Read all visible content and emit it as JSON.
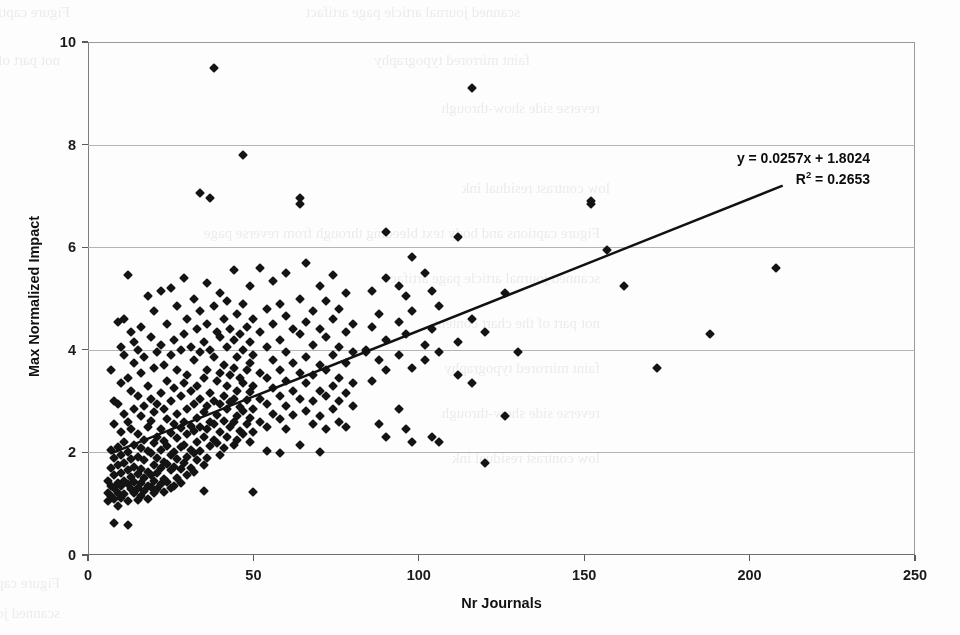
{
  "page": {
    "background_color": "#fdfdfd",
    "width": 960,
    "height": 635,
    "scan_bleed_text": [
      "Figure captions and body text bleeding through from reverse page",
      "scanned journal article page artifact",
      "not part of the chart content",
      "faint mirrored typography",
      "reverse side show-through",
      "low contrast residual ink"
    ]
  },
  "chart_data": {
    "type": "scatter",
    "title": "",
    "xlabel": "Nr Journals",
    "ylabel": "Max Normalized Impact",
    "xlim": [
      0,
      250
    ],
    "ylim": [
      0,
      10
    ],
    "xticks": [
      0,
      50,
      100,
      150,
      200,
      250
    ],
    "yticks": [
      0,
      2,
      4,
      6,
      8,
      10
    ],
    "grid": "horizontal",
    "legend": "none",
    "marker": "diamond",
    "marker_color": "#141414",
    "marker_size": 7,
    "annotations": {
      "equation": "y = 0.0257x + 1.8024",
      "r_squared_prefix": "R",
      "r_squared_exponent": "2",
      "r_squared_value": " = 0.2653"
    },
    "trendline": {
      "type": "linear",
      "slope": 0.0257,
      "intercept": 1.8024,
      "r_squared": 0.2653,
      "x_start": 7,
      "x_end": 210,
      "color": "#111111",
      "width": 2.4
    },
    "points": [
      [
        6,
        1.45
      ],
      [
        6,
        1.2
      ],
      [
        6,
        1.05
      ],
      [
        7,
        3.6
      ],
      [
        7,
        2.05
      ],
      [
        7,
        1.7
      ],
      [
        7,
        1.35
      ],
      [
        7,
        1.15
      ],
      [
        8,
        3.0
      ],
      [
        8,
        2.55
      ],
      [
        8,
        1.9
      ],
      [
        8,
        1.55
      ],
      [
        8,
        1.3
      ],
      [
        8,
        1.1
      ],
      [
        8,
        0.62
      ],
      [
        9,
        4.55
      ],
      [
        9,
        2.95
      ],
      [
        9,
        2.1
      ],
      [
        9,
        1.75
      ],
      [
        9,
        1.4
      ],
      [
        9,
        1.2
      ],
      [
        9,
        0.95
      ],
      [
        10,
        4.05
      ],
      [
        10,
        3.35
      ],
      [
        10,
        2.4
      ],
      [
        10,
        1.95
      ],
      [
        10,
        1.6
      ],
      [
        10,
        1.35
      ],
      [
        10,
        1.12
      ],
      [
        11,
        4.6
      ],
      [
        11,
        3.9
      ],
      [
        11,
        2.75
      ],
      [
        11,
        2.2
      ],
      [
        11,
        1.8
      ],
      [
        11,
        1.45
      ],
      [
        11,
        1.18
      ],
      [
        12,
        5.45
      ],
      [
        12,
        3.45
      ],
      [
        12,
        2.6
      ],
      [
        12,
        2.0
      ],
      [
        12,
        1.65
      ],
      [
        12,
        1.38
      ],
      [
        12,
        1.05
      ],
      [
        12,
        0.58
      ],
      [
        13,
        4.35
      ],
      [
        13,
        3.2
      ],
      [
        13,
        2.45
      ],
      [
        13,
        1.88
      ],
      [
        13,
        1.52
      ],
      [
        13,
        1.28
      ],
      [
        14,
        4.15
      ],
      [
        14,
        3.75
      ],
      [
        14,
        2.85
      ],
      [
        14,
        2.15
      ],
      [
        14,
        1.72
      ],
      [
        14,
        1.42
      ],
      [
        14,
        1.2
      ],
      [
        15,
        4.0
      ],
      [
        15,
        3.1
      ],
      [
        15,
        2.35
      ],
      [
        15,
        1.92
      ],
      [
        15,
        1.58
      ],
      [
        15,
        1.3
      ],
      [
        15,
        1.08
      ],
      [
        16,
        4.45
      ],
      [
        16,
        3.55
      ],
      [
        16,
        2.7
      ],
      [
        16,
        2.08
      ],
      [
        16,
        1.68
      ],
      [
        16,
        1.4
      ],
      [
        16,
        1.15
      ],
      [
        17,
        3.85
      ],
      [
        17,
        2.9
      ],
      [
        17,
        2.25
      ],
      [
        17,
        1.85
      ],
      [
        17,
        1.5
      ],
      [
        17,
        1.25
      ],
      [
        18,
        5.05
      ],
      [
        18,
        3.3
      ],
      [
        18,
        2.5
      ],
      [
        18,
        2.02
      ],
      [
        18,
        1.62
      ],
      [
        18,
        1.35
      ],
      [
        18,
        1.1
      ],
      [
        19,
        4.25
      ],
      [
        19,
        3.05
      ],
      [
        19,
        2.62
      ],
      [
        19,
        1.98
      ],
      [
        19,
        1.55
      ],
      [
        19,
        1.32
      ],
      [
        20,
        4.75
      ],
      [
        20,
        3.65
      ],
      [
        20,
        2.78
      ],
      [
        20,
        2.18
      ],
      [
        20,
        1.75
      ],
      [
        20,
        1.45
      ],
      [
        20,
        1.2
      ],
      [
        21,
        3.95
      ],
      [
        21,
        2.95
      ],
      [
        21,
        2.3
      ],
      [
        21,
        1.9
      ],
      [
        21,
        1.6
      ],
      [
        21,
        1.28
      ],
      [
        22,
        5.15
      ],
      [
        22,
        4.1
      ],
      [
        22,
        3.15
      ],
      [
        22,
        2.45
      ],
      [
        22,
        2.05
      ],
      [
        22,
        1.7
      ],
      [
        22,
        1.38
      ],
      [
        23,
        3.7
      ],
      [
        23,
        2.85
      ],
      [
        23,
        2.22
      ],
      [
        23,
        1.82
      ],
      [
        23,
        1.48
      ],
      [
        23,
        1.22
      ],
      [
        24,
        4.5
      ],
      [
        24,
        3.4
      ],
      [
        24,
        2.65
      ],
      [
        24,
        2.12
      ],
      [
        24,
        1.78
      ],
      [
        24,
        1.42
      ],
      [
        25,
        5.2
      ],
      [
        25,
        3.9
      ],
      [
        25,
        3.0
      ],
      [
        25,
        2.38
      ],
      [
        25,
        1.95
      ],
      [
        25,
        1.65
      ],
      [
        25,
        1.3
      ],
      [
        26,
        4.2
      ],
      [
        26,
        3.25
      ],
      [
        26,
        2.55
      ],
      [
        26,
        2.0
      ],
      [
        26,
        1.72
      ],
      [
        26,
        1.35
      ],
      [
        27,
        4.85
      ],
      [
        27,
        3.6
      ],
      [
        27,
        2.75
      ],
      [
        27,
        2.28
      ],
      [
        27,
        1.88
      ],
      [
        27,
        1.5
      ],
      [
        28,
        4.0
      ],
      [
        28,
        3.1
      ],
      [
        28,
        2.48
      ],
      [
        28,
        2.1
      ],
      [
        28,
        1.68
      ],
      [
        28,
        1.4
      ],
      [
        29,
        5.4
      ],
      [
        29,
        4.3
      ],
      [
        29,
        3.35
      ],
      [
        29,
        2.6
      ],
      [
        29,
        2.15
      ],
      [
        29,
        1.8
      ],
      [
        30,
        4.6
      ],
      [
        30,
        3.5
      ],
      [
        30,
        2.85
      ],
      [
        30,
        2.35
      ],
      [
        30,
        1.92
      ],
      [
        30,
        1.55
      ],
      [
        31,
        4.05
      ],
      [
        31,
        3.2
      ],
      [
        31,
        2.52
      ],
      [
        31,
        2.05
      ],
      [
        31,
        1.7
      ],
      [
        32,
        5.0
      ],
      [
        32,
        3.8
      ],
      [
        32,
        2.95
      ],
      [
        32,
        2.42
      ],
      [
        32,
        1.98
      ],
      [
        32,
        1.62
      ],
      [
        33,
        4.4
      ],
      [
        33,
        3.3
      ],
      [
        33,
        2.68
      ],
      [
        33,
        2.2
      ],
      [
        33,
        1.85
      ],
      [
        34,
        7.05
      ],
      [
        34,
        4.75
      ],
      [
        34,
        3.95
      ],
      [
        34,
        3.05
      ],
      [
        34,
        2.5
      ],
      [
        34,
        2.02
      ],
      [
        35,
        4.15
      ],
      [
        35,
        3.45
      ],
      [
        35,
        2.78
      ],
      [
        35,
        2.3
      ],
      [
        35,
        1.75
      ],
      [
        35,
        1.25
      ],
      [
        36,
        5.3
      ],
      [
        36,
        4.5
      ],
      [
        36,
        3.6
      ],
      [
        36,
        2.9
      ],
      [
        36,
        2.45
      ],
      [
        36,
        1.9
      ],
      [
        37,
        6.95
      ],
      [
        37,
        4.0
      ],
      [
        37,
        3.15
      ],
      [
        37,
        2.6
      ],
      [
        37,
        2.12
      ],
      [
        38,
        9.5
      ],
      [
        38,
        4.85
      ],
      [
        38,
        3.85
      ],
      [
        38,
        3.0
      ],
      [
        38,
        2.55
      ],
      [
        38,
        2.25
      ],
      [
        39,
        4.35
      ],
      [
        39,
        3.4
      ],
      [
        39,
        2.72
      ],
      [
        39,
        2.18
      ],
      [
        40,
        5.1
      ],
      [
        40,
        4.25
      ],
      [
        40,
        3.55
      ],
      [
        40,
        2.95
      ],
      [
        40,
        2.4
      ],
      [
        40,
        1.95
      ],
      [
        41,
        4.6
      ],
      [
        41,
        3.7
      ],
      [
        41,
        3.1
      ],
      [
        41,
        2.62
      ],
      [
        41,
        2.08
      ],
      [
        42,
        4.95
      ],
      [
        42,
        4.05
      ],
      [
        42,
        3.3
      ],
      [
        42,
        2.85
      ],
      [
        42,
        2.3
      ],
      [
        43,
        4.4
      ],
      [
        43,
        3.5
      ],
      [
        43,
        2.98
      ],
      [
        43,
        2.5
      ],
      [
        44,
        5.55
      ],
      [
        44,
        4.2
      ],
      [
        44,
        3.65
      ],
      [
        44,
        3.05
      ],
      [
        44,
        2.6
      ],
      [
        44,
        2.15
      ],
      [
        45,
        4.7
      ],
      [
        45,
        3.85
      ],
      [
        45,
        3.2
      ],
      [
        45,
        2.7
      ],
      [
        45,
        2.25
      ],
      [
        46,
        4.3
      ],
      [
        46,
        3.45
      ],
      [
        46,
        2.88
      ],
      [
        46,
        2.42
      ],
      [
        47,
        7.8
      ],
      [
        47,
        4.9
      ],
      [
        47,
        4.0
      ],
      [
        47,
        3.35
      ],
      [
        47,
        2.8
      ],
      [
        47,
        2.35
      ],
      [
        48,
        4.45
      ],
      [
        48,
        3.6
      ],
      [
        48,
        3.02
      ],
      [
        48,
        2.55
      ],
      [
        49,
        5.25
      ],
      [
        49,
        4.15
      ],
      [
        49,
        3.75
      ],
      [
        49,
        3.18
      ],
      [
        49,
        2.68
      ],
      [
        49,
        2.2
      ],
      [
        50,
        4.6
      ],
      [
        50,
        3.9
      ],
      [
        50,
        3.3
      ],
      [
        50,
        2.85
      ],
      [
        50,
        2.4
      ],
      [
        50,
        1.22
      ],
      [
        52,
        5.6
      ],
      [
        52,
        4.35
      ],
      [
        52,
        3.55
      ],
      [
        52,
        3.05
      ],
      [
        52,
        2.6
      ],
      [
        54,
        4.8
      ],
      [
        54,
        4.05
      ],
      [
        54,
        3.45
      ],
      [
        54,
        2.95
      ],
      [
        54,
        2.5
      ],
      [
        54,
        2.02
      ],
      [
        56,
        5.35
      ],
      [
        56,
        4.5
      ],
      [
        56,
        3.8
      ],
      [
        56,
        3.25
      ],
      [
        56,
        2.75
      ],
      [
        58,
        4.9
      ],
      [
        58,
        4.2
      ],
      [
        58,
        3.6
      ],
      [
        58,
        3.1
      ],
      [
        58,
        2.65
      ],
      [
        58,
        1.98
      ],
      [
        60,
        5.5
      ],
      [
        60,
        4.65
      ],
      [
        60,
        3.95
      ],
      [
        60,
        3.4
      ],
      [
        60,
        2.9
      ],
      [
        60,
        2.45
      ],
      [
        62,
        4.4
      ],
      [
        62,
        3.75
      ],
      [
        62,
        3.2
      ],
      [
        62,
        2.72
      ],
      [
        64,
        6.95
      ],
      [
        64,
        6.85
      ],
      [
        64,
        5.0
      ],
      [
        64,
        4.3
      ],
      [
        64,
        3.55
      ],
      [
        64,
        3.05
      ],
      [
        64,
        2.15
      ],
      [
        66,
        5.7
      ],
      [
        66,
        4.55
      ],
      [
        66,
        3.85
      ],
      [
        66,
        3.35
      ],
      [
        66,
        2.8
      ],
      [
        68,
        4.75
      ],
      [
        68,
        4.1
      ],
      [
        68,
        3.5
      ],
      [
        68,
        3.0
      ],
      [
        68,
        2.55
      ],
      [
        70,
        5.25
      ],
      [
        70,
        4.4
      ],
      [
        70,
        3.7
      ],
      [
        70,
        3.2
      ],
      [
        70,
        2.7
      ],
      [
        70,
        2.0
      ],
      [
        72,
        4.95
      ],
      [
        72,
        4.25
      ],
      [
        72,
        3.6
      ],
      [
        72,
        3.1
      ],
      [
        72,
        2.45
      ],
      [
        74,
        5.45
      ],
      [
        74,
        4.6
      ],
      [
        74,
        3.9
      ],
      [
        74,
        3.3
      ],
      [
        74,
        2.85
      ],
      [
        76,
        4.8
      ],
      [
        76,
        4.05
      ],
      [
        76,
        3.45
      ],
      [
        76,
        3.0
      ],
      [
        76,
        2.6
      ],
      [
        78,
        5.1
      ],
      [
        78,
        4.35
      ],
      [
        78,
        3.75
      ],
      [
        78,
        3.15
      ],
      [
        78,
        2.5
      ],
      [
        80,
        4.5
      ],
      [
        80,
        3.95
      ],
      [
        80,
        3.35
      ],
      [
        80,
        2.9
      ],
      [
        84,
        4.0
      ],
      [
        84,
        3.95
      ],
      [
        86,
        5.15
      ],
      [
        86,
        4.45
      ],
      [
        86,
        3.4
      ],
      [
        88,
        4.7
      ],
      [
        88,
        3.8
      ],
      [
        88,
        2.55
      ],
      [
        90,
        6.3
      ],
      [
        90,
        5.4
      ],
      [
        90,
        4.2
      ],
      [
        90,
        3.6
      ],
      [
        90,
        2.3
      ],
      [
        94,
        5.25
      ],
      [
        94,
        4.55
      ],
      [
        94,
        3.9
      ],
      [
        94,
        2.85
      ],
      [
        96,
        5.05
      ],
      [
        96,
        4.3
      ],
      [
        96,
        2.45
      ],
      [
        98,
        5.8
      ],
      [
        98,
        4.75
      ],
      [
        98,
        3.65
      ],
      [
        98,
        2.2
      ],
      [
        102,
        5.5
      ],
      [
        102,
        4.1
      ],
      [
        102,
        3.8
      ],
      [
        104,
        5.15
      ],
      [
        104,
        4.4
      ],
      [
        104,
        2.3
      ],
      [
        106,
        4.85
      ],
      [
        106,
        3.95
      ],
      [
        106,
        2.2
      ],
      [
        112,
        6.2
      ],
      [
        112,
        4.15
      ],
      [
        112,
        3.5
      ],
      [
        116,
        9.1
      ],
      [
        116,
        4.6
      ],
      [
        116,
        3.35
      ],
      [
        120,
        4.35
      ],
      [
        120,
        1.8
      ],
      [
        126,
        5.1
      ],
      [
        126,
        2.7
      ],
      [
        130,
        3.95
      ],
      [
        152,
        6.9
      ],
      [
        152,
        6.85
      ],
      [
        157,
        5.95
      ],
      [
        162,
        5.25
      ],
      [
        172,
        3.65
      ],
      [
        188,
        4.3
      ],
      [
        208,
        5.6
      ]
    ]
  }
}
